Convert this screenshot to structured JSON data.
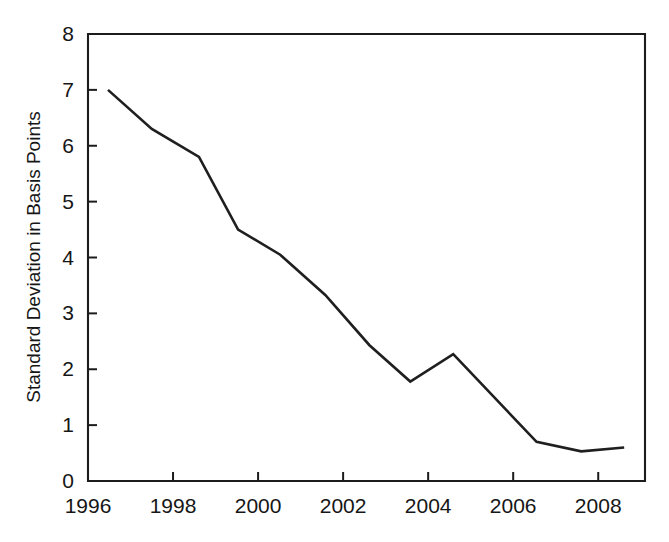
{
  "chart_data": {
    "type": "line",
    "title": "",
    "xlabel": "",
    "ylabel": "Standard Deviation in Basis Points",
    "xlim": [
      1996,
      2009.1
    ],
    "ylim": [
      0,
      8
    ],
    "grid": false,
    "legend": null,
    "x_ticks": [
      "1996",
      "1998",
      "2000",
      "2002",
      "2004",
      "2006",
      "2008"
    ],
    "x_tick_values": [
      1996,
      1998,
      2000,
      2002,
      2004,
      2006,
      2008
    ],
    "y_ticks": [
      "0",
      "1",
      "2",
      "3",
      "4",
      "5",
      "6",
      "7",
      "8"
    ],
    "y_tick_values": [
      0,
      1,
      2,
      3,
      4,
      5,
      6,
      7,
      8
    ],
    "series": [
      {
        "name": "Standard Deviation",
        "color": "#1f1f1f",
        "x": [
          1996.47,
          1997.5,
          1998.61,
          1999.53,
          2000.52,
          2001.58,
          2002.62,
          2003.58,
          2004.59,
          2006.55,
          2007.6,
          2008.61
        ],
        "values": [
          7.0,
          6.3,
          5.8,
          4.5,
          4.05,
          3.33,
          2.43,
          1.78,
          2.27,
          0.7,
          0.53,
          0.6
        ]
      }
    ]
  },
  "figure": {
    "background_color": "#ffffff",
    "line_color": "#1f1f1f",
    "axis_color": "#1c1c1c"
  }
}
